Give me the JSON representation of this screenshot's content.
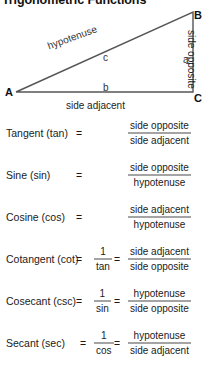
{
  "title": "Trigonometric Functions",
  "diagram": {
    "vertices": {
      "a": "A",
      "b": "B",
      "c": "C"
    },
    "side_letters": {
      "hypotenuse": "c",
      "adjacent": "b",
      "opposite": "a"
    },
    "labels": {
      "hypotenuse": "hypotenuse",
      "side_adjacent": "side adjacent",
      "side_opposite": "side opposite"
    },
    "stroke_color": "#555555"
  },
  "formulas": [
    {
      "name": "Tangent (tan)",
      "equals": "=",
      "numerator": "side opposite",
      "denominator": "side adjacent",
      "has_reciprocal": false,
      "reciprocal_numerator": "",
      "reciprocal_denominator": ""
    },
    {
      "name": "Sine (sin)",
      "equals": "=",
      "numerator": "side opposite",
      "denominator": "hypotenuse",
      "has_reciprocal": false,
      "reciprocal_numerator": "",
      "reciprocal_denominator": ""
    },
    {
      "name": "Cosine (cos)",
      "equals": "=",
      "numerator": "side adjacent",
      "denominator": "hypotenuse",
      "has_reciprocal": false,
      "reciprocal_numerator": "",
      "reciprocal_denominator": ""
    },
    {
      "name": "Cotangent (cot)",
      "equals": "=",
      "equals2": "=",
      "numerator": "side adjacent",
      "denominator": "side opposite",
      "has_reciprocal": true,
      "reciprocal_numerator": "1",
      "reciprocal_denominator": "tan"
    },
    {
      "name": "Cosecant (csc)",
      "equals": "=",
      "equals2": "=",
      "numerator": "hypotenuse",
      "denominator": "side opposite",
      "has_reciprocal": true,
      "reciprocal_numerator": "1",
      "reciprocal_denominator": "sin"
    },
    {
      "name": "Secant (sec)",
      "equals": "=",
      "equals2": "=",
      "numerator": "hypotenuse",
      "denominator": "side adjacent",
      "has_reciprocal": true,
      "reciprocal_numerator": "1",
      "reciprocal_denominator": "cos"
    }
  ]
}
